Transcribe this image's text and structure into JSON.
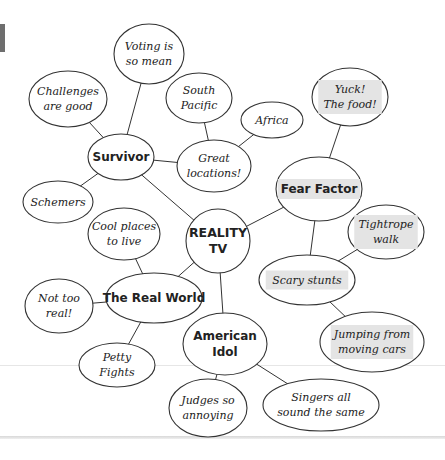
{
  "diagram": {
    "type": "mind-map",
    "center": {
      "id": "reality_tv",
      "lines": [
        "REALITY",
        "TV"
      ],
      "cx": 218,
      "cy": 241,
      "rx": 32,
      "ry": 32,
      "kind": "center"
    },
    "nodes": [
      {
        "id": "survivor",
        "lines": [
          "Survivor"
        ],
        "cx": 121,
        "cy": 157,
        "rx": 33,
        "ry": 23,
        "kind": "topic"
      },
      {
        "id": "voting",
        "lines": [
          "Voting is",
          "so mean"
        ],
        "cx": 149,
        "cy": 54,
        "rx": 35,
        "ry": 30,
        "kind": "leaf"
      },
      {
        "id": "challenges",
        "lines": [
          "Challenges",
          "are good"
        ],
        "cx": 68,
        "cy": 99,
        "rx": 39,
        "ry": 28,
        "kind": "leaf"
      },
      {
        "id": "schemers",
        "lines": [
          "Schemers"
        ],
        "cx": 58,
        "cy": 202,
        "rx": 35,
        "ry": 21,
        "kind": "leaf"
      },
      {
        "id": "great_locations",
        "lines": [
          "Great",
          "locations!"
        ],
        "cx": 214,
        "cy": 166,
        "rx": 37,
        "ry": 26,
        "kind": "leaf"
      },
      {
        "id": "south_pacific",
        "lines": [
          "South",
          "Pacific"
        ],
        "cx": 199,
        "cy": 98,
        "rx": 33,
        "ry": 25,
        "kind": "leaf"
      },
      {
        "id": "africa",
        "lines": [
          "Africa"
        ],
        "cx": 272,
        "cy": 120,
        "rx": 31,
        "ry": 18,
        "kind": "leaf"
      },
      {
        "id": "fear_factor",
        "lines": [
          "Fear Factor"
        ],
        "cx": 319,
        "cy": 189,
        "rx": 43,
        "ry": 32,
        "kind": "topic",
        "highlight": true
      },
      {
        "id": "yuck",
        "lines": [
          "Yuck!",
          "The food!"
        ],
        "cx": 350,
        "cy": 97,
        "rx": 38,
        "ry": 29,
        "kind": "leaf",
        "highlight": true
      },
      {
        "id": "scary_stunts",
        "lines": [
          "Scary stunts"
        ],
        "cx": 307,
        "cy": 280,
        "rx": 48,
        "ry": 25,
        "kind": "leaf",
        "highlight": true
      },
      {
        "id": "tightrope",
        "lines": [
          "Tightrope",
          "walk"
        ],
        "cx": 386,
        "cy": 232,
        "rx": 38,
        "ry": 27,
        "kind": "leaf",
        "highlight": true
      },
      {
        "id": "jumping",
        "lines": [
          "Jumping from",
          "moving cars"
        ],
        "cx": 372,
        "cy": 342,
        "rx": 52,
        "ry": 30,
        "kind": "leaf",
        "highlight": true
      },
      {
        "id": "real_world",
        "lines": [
          "The Real World"
        ],
        "cx": 154,
        "cy": 298,
        "rx": 48,
        "ry": 25,
        "kind": "topic"
      },
      {
        "id": "cool_places",
        "lines": [
          "Cool places",
          "to live"
        ],
        "cx": 124,
        "cy": 234,
        "rx": 36,
        "ry": 26,
        "kind": "leaf"
      },
      {
        "id": "not_too_real",
        "lines": [
          "Not too",
          "real!"
        ],
        "cx": 59,
        "cy": 306,
        "rx": 34,
        "ry": 27,
        "kind": "leaf"
      },
      {
        "id": "petty_fights",
        "lines": [
          "Petty",
          "Fights"
        ],
        "cx": 117,
        "cy": 365,
        "rx": 38,
        "ry": 22,
        "kind": "leaf"
      },
      {
        "id": "american_idol",
        "lines": [
          "American",
          "Idol"
        ],
        "cx": 225,
        "cy": 344,
        "rx": 42,
        "ry": 31,
        "kind": "topic"
      },
      {
        "id": "judges",
        "lines": [
          "Judges so",
          "annoying"
        ],
        "cx": 208,
        "cy": 408,
        "rx": 39,
        "ry": 29,
        "kind": "leaf"
      },
      {
        "id": "singers",
        "lines": [
          "Singers all",
          "sound the same"
        ],
        "cx": 321,
        "cy": 405,
        "rx": 58,
        "ry": 26,
        "kind": "leaf"
      }
    ],
    "edges": [
      [
        "reality_tv",
        "survivor"
      ],
      [
        "reality_tv",
        "fear_factor"
      ],
      [
        "reality_tv",
        "real_world"
      ],
      [
        "reality_tv",
        "american_idol"
      ],
      [
        "survivor",
        "voting"
      ],
      [
        "survivor",
        "challenges"
      ],
      [
        "survivor",
        "schemers"
      ],
      [
        "survivor",
        "great_locations"
      ],
      [
        "great_locations",
        "south_pacific"
      ],
      [
        "great_locations",
        "africa"
      ],
      [
        "fear_factor",
        "yuck"
      ],
      [
        "fear_factor",
        "scary_stunts"
      ],
      [
        "scary_stunts",
        "tightrope"
      ],
      [
        "scary_stunts",
        "jumping"
      ],
      [
        "real_world",
        "cool_places"
      ],
      [
        "real_world",
        "not_too_real"
      ],
      [
        "real_world",
        "petty_fights"
      ],
      [
        "american_idol",
        "judges"
      ],
      [
        "american_idol",
        "singers"
      ]
    ]
  },
  "colors": {
    "stroke": "#333333",
    "highlight": "#e4e4e4",
    "page_line_light": "#e6e6e6",
    "page_line_dark": "#cfcfcf",
    "tab_marker": "#6e6e6e"
  }
}
